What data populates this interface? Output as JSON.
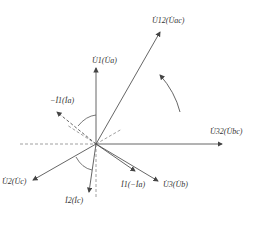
{
  "diagram": {
    "type": "phasor-diagram",
    "origin": {
      "x": 96,
      "y": 144
    },
    "colors": {
      "solid": "#555555",
      "dashed": "#888888",
      "text": "#333333"
    },
    "phasors": [
      {
        "id": "U12",
        "label": "U̇12(U̇ac)",
        "x2": 160,
        "y2": 32,
        "style": "solid"
      },
      {
        "id": "U1",
        "label": "U̇1(U̇a)",
        "x2": 96,
        "y2": 68,
        "style": "solid"
      },
      {
        "id": "negI1",
        "label": "−İ1(İa)",
        "x2": 57,
        "y2": 112,
        "style": "dashed"
      },
      {
        "id": "U32",
        "label": "U̇32(U̇bc)",
        "x2": 222,
        "y2": 144,
        "style": "solid"
      },
      {
        "id": "U2",
        "label": "U̇2(U̇c)",
        "x2": 33,
        "y2": 180,
        "style": "solid"
      },
      {
        "id": "I2",
        "label": "İ2(İc)",
        "x2": 89,
        "y2": 192,
        "style": "solid"
      },
      {
        "id": "I1",
        "label": "İ1(−İa)",
        "x2": 135,
        "y2": 171,
        "style": "solid"
      },
      {
        "id": "U3",
        "label": "U̇3(U̇b)",
        "x2": 158,
        "y2": 181,
        "style": "solid"
      }
    ],
    "labels": {
      "u12": "U̇12(U̇ac)",
      "u1": "U̇1(U̇a)",
      "neg_i1": "−İ1(İa)",
      "u32": "U̇32(U̇bc)",
      "u2": "U̇2(U̇c)",
      "i2": "İ2(İc)",
      "i1": "İ1(−İa)",
      "u3": "U̇3(U̇b)"
    },
    "rotation_arrow": "counter-clockwise",
    "caption": ""
  }
}
